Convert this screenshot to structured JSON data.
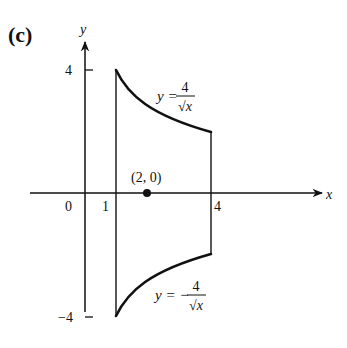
{
  "figure": {
    "panel_label": "(c)",
    "axes": {
      "x_label": "x",
      "y_label": "y",
      "origin_label": "0",
      "x_ticks": [
        "1",
        "4"
      ],
      "y_ticks": [
        "4",
        "−4"
      ]
    },
    "curves": {
      "upper": {
        "lhs": "y =",
        "numerator": "4",
        "denominator": "√x"
      },
      "lower": {
        "lhs": "y = −",
        "numerator": "4",
        "denominator": "√x"
      }
    },
    "point": {
      "label": "(2, 0)",
      "x": 2,
      "y": 0
    },
    "region": {
      "x_min": 1,
      "x_max": 4
    },
    "colors": {
      "ink": "#111111",
      "background": "#ffffff"
    }
  }
}
